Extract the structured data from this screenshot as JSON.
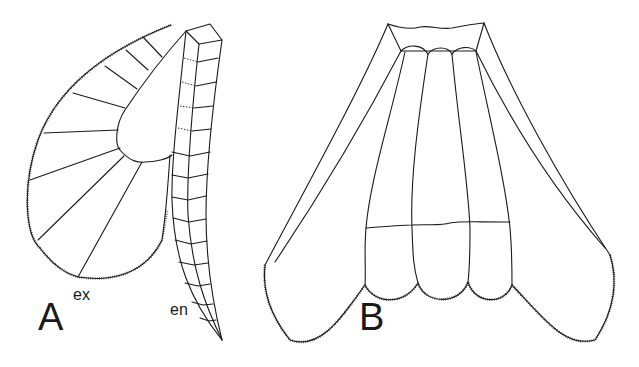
{
  "figure": {
    "panels": [
      {
        "id": "A",
        "label": "A",
        "parts": [
          {
            "abbr": "ex",
            "label": "ex"
          },
          {
            "abbr": "en",
            "label": "en"
          }
        ]
      },
      {
        "id": "B",
        "label": "B"
      }
    ]
  },
  "colors": {
    "line": "#1a1a1a",
    "background": "#ffffff"
  }
}
